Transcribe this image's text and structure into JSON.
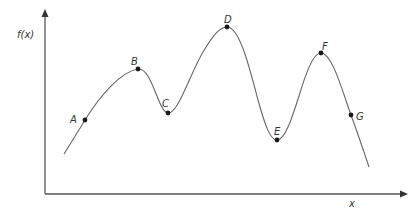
{
  "diagram": {
    "y_axis_label": "f(x)",
    "x_axis_label": "x",
    "colors": {
      "axis": "#555555",
      "curve": "#666666",
      "point": "#1a1a1a",
      "label": "#333333"
    },
    "points": [
      {
        "label": "A",
        "x": 85,
        "y": 120,
        "label_dx": -15,
        "label_dy": 3,
        "type": "increasing"
      },
      {
        "label": "B",
        "x": 138,
        "y": 69,
        "label_dx": -7,
        "label_dy": -4,
        "type": "local-maximum"
      },
      {
        "label": "C",
        "x": 168,
        "y": 113,
        "label_dx": -6,
        "label_dy": -6,
        "type": "local-minimum"
      },
      {
        "label": "D",
        "x": 227,
        "y": 27,
        "label_dx": -3,
        "label_dy": -4,
        "type": "global-maximum"
      },
      {
        "label": "E",
        "x": 277,
        "y": 140,
        "label_dx": -3,
        "label_dy": -5,
        "type": "global-minimum"
      },
      {
        "label": "F",
        "x": 321,
        "y": 53,
        "label_dx": 1,
        "label_dy": -3,
        "type": "local-maximum"
      },
      {
        "label": "G",
        "x": 351,
        "y": 115,
        "label_dx": 5,
        "label_dy": 5,
        "type": "decreasing"
      }
    ]
  }
}
